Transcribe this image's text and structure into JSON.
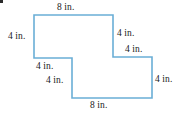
{
  "figure": {
    "kind": "step-polygon-dimensioned-figure",
    "units": "in.",
    "stroke_color": "#6aaed6",
    "fill_color": "#ffffff",
    "label_color": "#1a1a1a",
    "bullet_color": "#2b2b2b",
    "stroke_width": 1.6,
    "view_box": "0 0 176 116",
    "outline_points": "34,15 113,15 113,57 152,57 152,98 72,98 72,58 34,58",
    "labels": [
      {
        "id": "top-edge",
        "text": "8 in."
      },
      {
        "id": "left-edge",
        "text": "4 in."
      },
      {
        "id": "upper-right-edge",
        "text": "4 in."
      },
      {
        "id": "middle-right-edge",
        "text": "4 in."
      },
      {
        "id": "inner-horizontal",
        "text": "4 in."
      },
      {
        "id": "inner-vertical",
        "text": "4 in."
      },
      {
        "id": "lower-right-edge",
        "text": "4 in."
      },
      {
        "id": "bottom-edge",
        "text": "8 in."
      }
    ]
  },
  "chart_data": {
    "type": "diagram",
    "title": "",
    "shape": "L-shaped step polygon (composite of two rectangles)",
    "unit": "in.",
    "vertices": [
      {
        "x": 0,
        "y": 8,
        "px": [
          34,
          15
        ]
      },
      {
        "x": 8,
        "y": 8,
        "px": [
          113,
          15
        ]
      },
      {
        "x": 8,
        "y": 4,
        "px": [
          113,
          57
        ]
      },
      {
        "x": 12,
        "y": 4,
        "px": [
          152,
          57
        ]
      },
      {
        "x": 12,
        "y": 0,
        "px": [
          152,
          98
        ]
      },
      {
        "x": 4,
        "y": 0,
        "px": [
          72,
          98
        ]
      },
      {
        "x": 4,
        "y": 4,
        "px": [
          72,
          58
        ]
      },
      {
        "x": 0,
        "y": 4,
        "px": [
          34,
          58
        ]
      }
    ],
    "edge_lengths": [
      {
        "edge": "top",
        "value": 8,
        "label": "8 in."
      },
      {
        "edge": "left",
        "value": 4,
        "label": "4 in."
      },
      {
        "edge": "upper-right-vertical",
        "value": 4,
        "label": "4 in."
      },
      {
        "edge": "middle-right-horizontal",
        "value": 4,
        "label": "4 in."
      },
      {
        "edge": "inner-horizontal",
        "value": 4,
        "label": "4 in."
      },
      {
        "edge": "inner-vertical",
        "value": 4,
        "label": "4 in."
      },
      {
        "edge": "lower-right-vertical",
        "value": 4,
        "label": "4 in."
      },
      {
        "edge": "bottom",
        "value": 8,
        "label": "8 in."
      }
    ],
    "xlabel": "",
    "ylabel": "",
    "grid": false,
    "legend": null
  }
}
